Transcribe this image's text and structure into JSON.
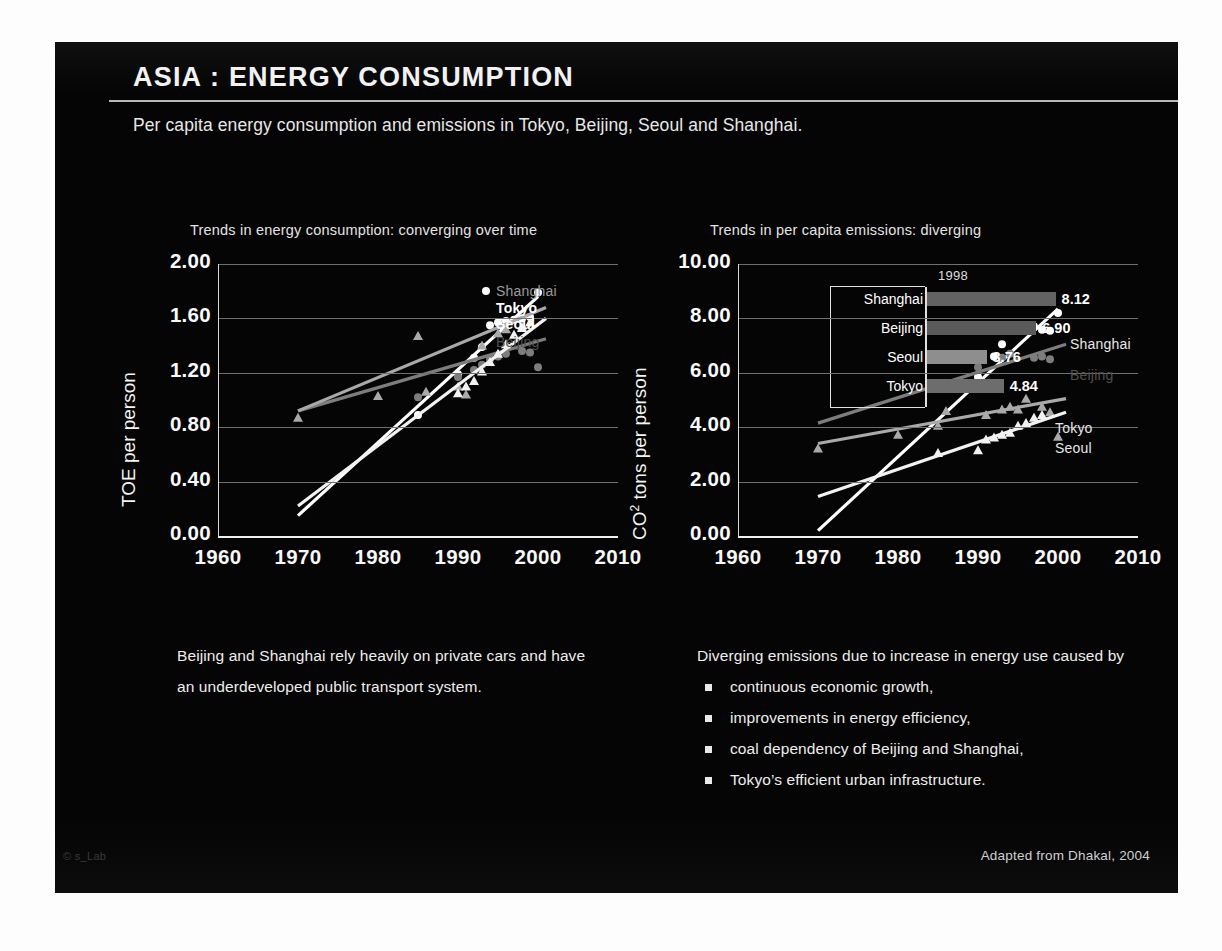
{
  "slide": {
    "title": "ASIA : ENERGY CONSUMPTION",
    "subtitle": "Per capita energy consumption and emissions in Tokyo, Beijing, Seoul and Shanghai.",
    "footer_left": "© s_Lab",
    "footer_right": "Adapted from Dhakal, 2004"
  },
  "left_text": {
    "paragraph": "Beijing and Shanghai rely heavily on private cars and have an underdeveloped public transport system."
  },
  "right_text": {
    "lead": "Diverging emissions due to increase in energy use caused by",
    "bullets": [
      "continuous economic growth,",
      "improvements in energy efficiency,",
      "coal dependency of Beijing and Shanghai,",
      "Tokyo’s efficient urban infrastructure."
    ]
  },
  "colors": {
    "shanghai": "#ffffff",
    "beijing": "#7d7d7d",
    "tokyo": "#a9a9a9",
    "seoul": "#f2f2f2",
    "grid": "#6f6f6f",
    "axis": "#f0f0f0",
    "background": "#050505"
  },
  "chart_data": [
    {
      "type": "scatter",
      "id": "energy-consumption",
      "title": "Trends in energy consumption: converging over time",
      "xlabel": "",
      "ylabel": "TOE per person",
      "xlim": [
        1960,
        2010
      ],
      "ylim": [
        0.0,
        2.0
      ],
      "xticks": [
        1960,
        1970,
        1980,
        1990,
        2000,
        2010
      ],
      "yticks": [
        "0.00",
        "0.40",
        "0.80",
        "1.20",
        "1.60",
        "2.00"
      ],
      "grid": true,
      "legend_position": "inside-top-right",
      "series": [
        {
          "name": "Shanghai",
          "marker": "circle",
          "color": "#ffffff",
          "label_color": "#9b9b9b",
          "points": [
            [
              1985,
              0.89
            ],
            [
              1990,
              1.19
            ],
            [
              1992,
              1.31
            ],
            [
              1993,
              1.39
            ],
            [
              1994,
              1.55
            ],
            [
              1995,
              1.57
            ],
            [
              1996,
              1.58
            ],
            [
              1997,
              1.59
            ],
            [
              1998,
              1.6
            ],
            [
              1999,
              1.61
            ],
            [
              2000,
              1.79
            ]
          ],
          "trend": [
            [
              1970,
              0.15
            ],
            [
              2000,
              1.76
            ]
          ]
        },
        {
          "name": "Beijing",
          "marker": "circle",
          "color": "#7d7d7d",
          "label_color": "#4f4f4f",
          "points": [
            [
              1985,
              1.02
            ],
            [
              1990,
              1.17
            ],
            [
              1992,
              1.22
            ],
            [
              1993,
              1.26
            ],
            [
              1994,
              1.3
            ],
            [
              1995,
              1.32
            ],
            [
              1996,
              1.34
            ],
            [
              1998,
              1.36
            ],
            [
              1999,
              1.35
            ],
            [
              2000,
              1.24
            ]
          ],
          "trend": [
            [
              1970,
              0.92
            ],
            [
              2001,
              1.45
            ]
          ]
        },
        {
          "name": "Tokyo",
          "marker": "triangle",
          "color": "#a9a9a9",
          "label_color": "#ffffff",
          "points": [
            [
              1970,
              0.87
            ],
            [
              1980,
              1.03
            ],
            [
              1985,
              1.47
            ],
            [
              1986,
              1.06
            ],
            [
              1990,
              1.1
            ],
            [
              1991,
              1.04
            ],
            [
              1993,
              1.4
            ],
            [
              1995,
              1.49
            ],
            [
              1996,
              1.52
            ],
            [
              1998,
              1.54
            ]
          ],
          "trend": [
            [
              1970,
              0.92
            ],
            [
              2001,
              1.68
            ]
          ]
        },
        {
          "name": "Seoul",
          "marker": "triangle",
          "color": "#f2f2f2",
          "label_color": "#ffffff",
          "points": [
            [
              1990,
              1.05
            ],
            [
              1991,
              1.1
            ],
            [
              1992,
              1.14
            ],
            [
              1993,
              1.21
            ],
            [
              1994,
              1.28
            ],
            [
              1995,
              1.34
            ],
            [
              1996,
              1.41
            ],
            [
              1997,
              1.48
            ],
            [
              1998,
              1.53
            ],
            [
              1999,
              1.57
            ]
          ],
          "trend": [
            [
              1970,
              0.22
            ],
            [
              2001,
              1.6
            ]
          ]
        }
      ]
    },
    {
      "type": "scatter",
      "id": "per-capita-emissions",
      "title": "Trends in per capita emissions: diverging",
      "xlabel": "",
      "ylabel": "CO2 tons per person",
      "ylabel_base": "CO",
      "ylabel_sup": "2",
      "ylabel_rest": " tons per person",
      "xlim": [
        1960,
        2010
      ],
      "ylim": [
        0.0,
        10.0
      ],
      "xticks": [
        1960,
        1970,
        1980,
        1990,
        2000,
        2010
      ],
      "yticks": [
        "0.00",
        "2.00",
        "4.00",
        "6.00",
        "8.00",
        "10.00"
      ],
      "grid": true,
      "legend_position": "inside-right",
      "series": [
        {
          "name": "Shanghai",
          "marker": "circle",
          "color": "#ffffff",
          "label_color": "#cfcfcf",
          "points": [
            [
              1990,
              5.85
            ],
            [
              1992,
              6.6
            ],
            [
              1993,
              7.05
            ],
            [
              1994,
              7.55
            ],
            [
              1995,
              7.6
            ],
            [
              1996,
              7.62
            ],
            [
              1997,
              7.7
            ],
            [
              1998,
              7.58
            ],
            [
              1999,
              7.55
            ],
            [
              2000,
              8.2
            ]
          ],
          "trend": [
            [
              1970,
              0.2
            ],
            [
              2000,
              8.35
            ]
          ]
        },
        {
          "name": "Beijing",
          "marker": "circle",
          "color": "#7d7d7d",
          "label_color": "#575757",
          "points": [
            [
              1985,
              5.5
            ],
            [
              1990,
              6.2
            ],
            [
              1993,
              6.55
            ],
            [
              1994,
              6.7
            ],
            [
              1997,
              6.55
            ],
            [
              1998,
              6.6
            ],
            [
              1999,
              6.5
            ]
          ],
          "trend": [
            [
              1970,
              4.15
            ],
            [
              2001,
              7.05
            ]
          ]
        },
        {
          "name": "Tokyo",
          "marker": "triangle",
          "color": "#a9a9a9",
          "label_color": "#ffffff",
          "points": [
            [
              1970,
              3.22
            ],
            [
              1980,
              3.72
            ],
            [
              1985,
              4.05
            ],
            [
              1986,
              4.6
            ],
            [
              1991,
              4.45
            ],
            [
              1993,
              4.65
            ],
            [
              1994,
              4.75
            ],
            [
              1995,
              4.65
            ],
            [
              1996,
              5.05
            ],
            [
              1998,
              4.75
            ],
            [
              1999,
              4.55
            ],
            [
              2000,
              3.65
            ]
          ],
          "trend": [
            [
              1970,
              3.4
            ],
            [
              2001,
              5.05
            ]
          ]
        },
        {
          "name": "Seoul",
          "marker": "triangle",
          "color": "#f2f2f2",
          "label_color": "#ffffff",
          "points": [
            [
              1985,
              3.05
            ],
            [
              1990,
              3.15
            ],
            [
              1991,
              3.55
            ],
            [
              1992,
              3.62
            ],
            [
              1993,
              3.72
            ],
            [
              1994,
              3.8
            ],
            [
              1995,
              4.05
            ],
            [
              1996,
              4.15
            ],
            [
              1997,
              4.35
            ],
            [
              1998,
              4.45
            ]
          ],
          "trend": [
            [
              1970,
              1.45
            ],
            [
              2001,
              4.55
            ]
          ]
        }
      ]
    },
    {
      "type": "bar",
      "id": "emissions-1998-inset",
      "orientation": "horizontal",
      "title": "1998",
      "xlabel": "",
      "ylabel": "",
      "categories": [
        "Shanghai",
        "Beijing",
        "Seoul",
        "Tokyo"
      ],
      "values": [
        8.12,
        6.9,
        3.76,
        4.84
      ],
      "value_labels": [
        "8.12",
        "6.90",
        "3.76",
        "4.84"
      ],
      "bar_colors": [
        "#636363",
        "#5a5a5a",
        "#8e8e8e",
        "#6d6d6d"
      ],
      "xlim": [
        0,
        10
      ]
    }
  ]
}
